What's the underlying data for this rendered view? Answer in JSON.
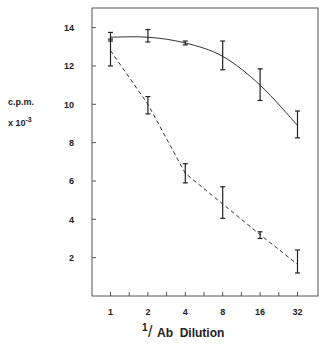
{
  "chart_data": {
    "type": "line",
    "title": "",
    "xlabel": "1/Ab Dilution",
    "xlabel_parts": {
      "numerator": "1",
      "slash": "/",
      "rest": "Ab  Dilution"
    },
    "ylabel": "c.p.m. x 10^-3",
    "ylabel_lines": {
      "line1": "c.p.m.",
      "line2_prefix": "x 10",
      "line2_exp": "-3"
    },
    "x_scale": "log2",
    "categories": [
      "1",
      "2",
      "4",
      "8",
      "16",
      "32"
    ],
    "x": [
      1,
      2,
      4,
      8,
      16,
      32
    ],
    "yticks": [
      2,
      4,
      6,
      8,
      10,
      12,
      14
    ],
    "ylim": [
      0,
      15
    ],
    "grid": false,
    "legend": null,
    "series": [
      {
        "name": "solid",
        "style": "solid",
        "values": [
          13.5,
          13.5,
          13.2,
          12.5,
          11.0,
          8.9
        ],
        "error_low": [
          13.3,
          13.25,
          13.1,
          11.8,
          10.2,
          8.25
        ],
        "error_high": [
          13.75,
          13.9,
          13.3,
          13.3,
          11.85,
          9.65
        ]
      },
      {
        "name": "dashed",
        "style": "dashed",
        "values": [
          12.8,
          10.0,
          6.4,
          4.8,
          3.2,
          1.65
        ],
        "error_low": [
          12.0,
          9.5,
          5.9,
          4.05,
          3.0,
          1.2
        ],
        "error_high": [
          13.4,
          10.4,
          6.9,
          5.7,
          3.35,
          2.4
        ]
      }
    ]
  },
  "colors": {
    "line": "#333333",
    "axis": "#555555",
    "text": "#222222"
  }
}
